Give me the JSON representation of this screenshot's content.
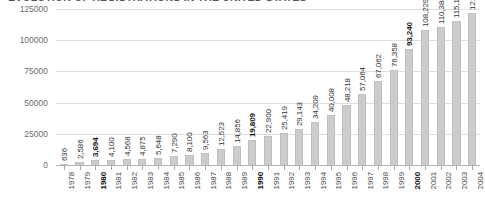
{
  "chart_data": {
    "type": "bar",
    "title": "EVOLUTION OF REGISTRATIONS IN THE UNITED STATES",
    "xlabel": "",
    "ylabel": "",
    "ylim": [
      0,
      125000
    ],
    "yticks": [
      0,
      25000,
      50000,
      75000,
      100000,
      125000
    ],
    "ytick_labels": [
      "0",
      "25000",
      "50000",
      "75000",
      "100000",
      "125000"
    ],
    "grid": true,
    "legend": "none",
    "bar_color": "#cccccc",
    "categories": [
      "1978",
      "1979",
      "1980",
      "1981",
      "1982",
      "1983",
      "1984",
      "1985",
      "1986",
      "1987",
      "1988",
      "1989",
      "1990",
      "1991",
      "1992",
      "1993",
      "1994",
      "1995",
      "1996",
      "1997",
      "1998",
      "1999",
      "2000",
      "2001",
      "2002",
      "2003",
      "2004"
    ],
    "values": [
      636,
      2586,
      3694,
      4100,
      4568,
      4875,
      5648,
      7290,
      8100,
      9563,
      12523,
      14856,
      19809,
      22900,
      25419,
      29143,
      34209,
      40008,
      48218,
      57064,
      67062,
      76358,
      93240,
      108229,
      110388,
      115178,
      121746
    ],
    "value_labels": [
      "636",
      "2,586",
      "3,694",
      "4,100",
      "4,568",
      "4,875",
      "5,648",
      "7,290",
      "8,100",
      "9,563",
      "12,523",
      "14,856",
      "19,809",
      "22,900",
      "25,419",
      "29,143",
      "34,209",
      "40,008",
      "48,218",
      "57,064",
      "67,062",
      "76,358",
      "93,240",
      "108,229",
      "110,388",
      "115,178",
      "121,746"
    ],
    "emphasized_categories": [
      "1980",
      "1990",
      "2000"
    ]
  }
}
